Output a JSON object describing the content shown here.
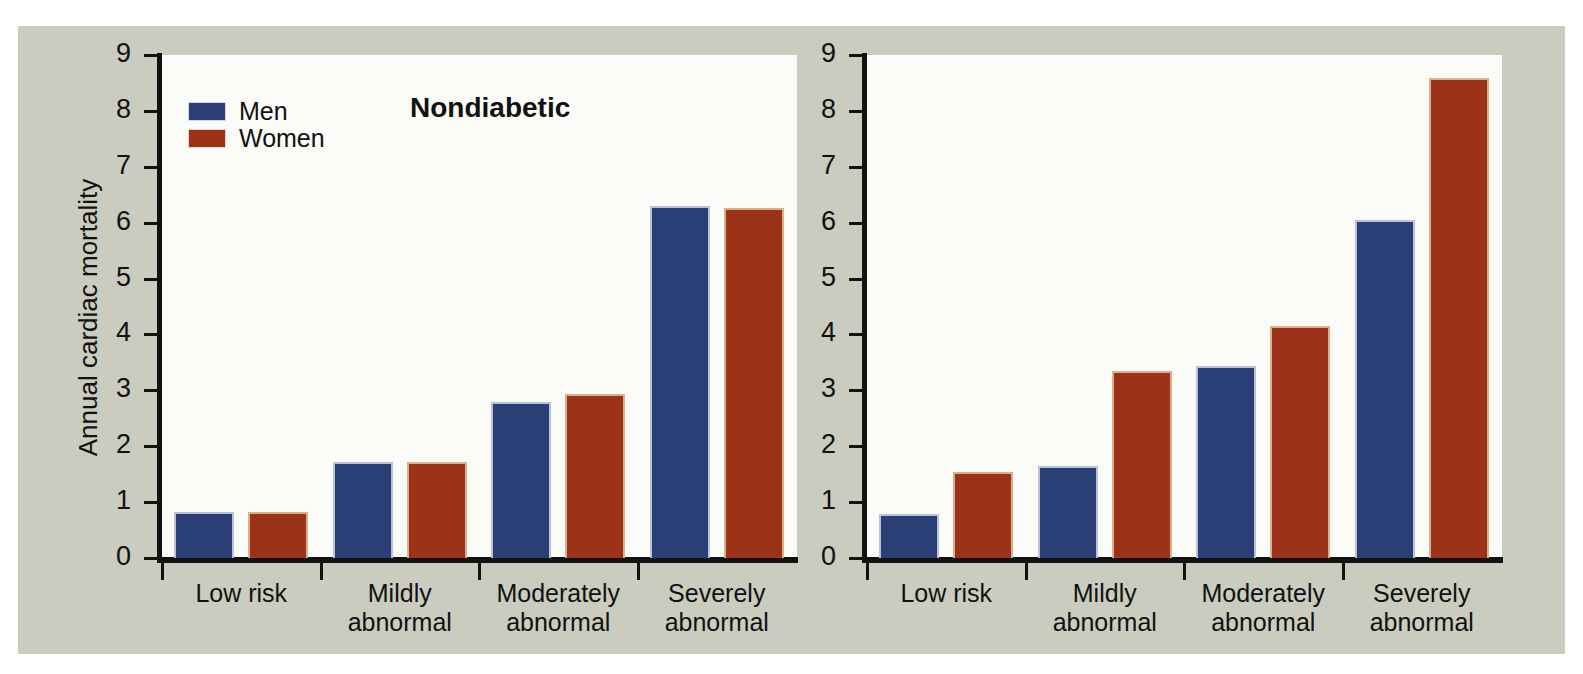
{
  "figure": {
    "background_color": "#c9ccbe",
    "plot_background_color": "#fbfbf7",
    "ylabel": "Annual cardiac mortality"
  },
  "legend": {
    "position": "top-left of left panel",
    "entries": [
      {
        "label": "Men",
        "color": "#2b3f77"
      },
      {
        "label": "Women",
        "color": "#9c3318"
      }
    ]
  },
  "panels": [
    {
      "title": "Nondiabetic"
    },
    {
      "title": "Diabetic"
    }
  ],
  "axis": {
    "yticks": [
      "0",
      "1",
      "2",
      "3",
      "4",
      "5",
      "6",
      "7",
      "8",
      "9"
    ],
    "categories": [
      {
        "line1": "Low risk",
        "line2": ""
      },
      {
        "line1": "Mildly",
        "line2": "abnormal"
      },
      {
        "line1": "Moderately",
        "line2": "abnormal"
      },
      {
        "line1": "Severely",
        "line2": "abnormal"
      }
    ]
  },
  "chart_data": [
    {
      "type": "bar",
      "title": "Nondiabetic",
      "xlabel": "",
      "ylabel": "Annual cardiac mortality",
      "ylim": [
        0,
        9
      ],
      "yticks": [
        0,
        1,
        2,
        3,
        4,
        5,
        6,
        7,
        8,
        9
      ],
      "grid": false,
      "legend_position": "upper left",
      "categories": [
        "Low risk",
        "Mildly abnormal",
        "Moderately abnormal",
        "Severely abnormal"
      ],
      "series": [
        {
          "name": "Men",
          "color": "#2b3f77",
          "values": [
            0.82,
            1.72,
            2.8,
            6.29
          ]
        },
        {
          "name": "Women",
          "color": "#9c3318",
          "values": [
            0.82,
            1.71,
            2.93,
            6.27
          ]
        }
      ]
    },
    {
      "type": "bar",
      "title": "Diabetic",
      "xlabel": "",
      "ylabel": "Annual cardiac mortality",
      "ylim": [
        0,
        9
      ],
      "yticks": [
        0,
        1,
        2,
        3,
        4,
        5,
        6,
        7,
        8,
        9
      ],
      "grid": false,
      "legend_position": "none",
      "categories": [
        "Low risk",
        "Mildly abnormal",
        "Moderately abnormal",
        "Severely abnormal"
      ],
      "series": [
        {
          "name": "Men",
          "color": "#2b3f77",
          "values": [
            0.79,
            1.65,
            3.44,
            6.04
          ]
        },
        {
          "name": "Women",
          "color": "#9c3318",
          "values": [
            1.54,
            3.35,
            4.16,
            8.58
          ]
        }
      ]
    }
  ]
}
